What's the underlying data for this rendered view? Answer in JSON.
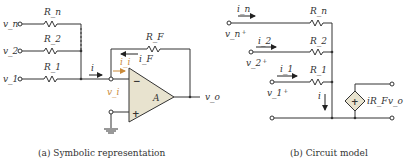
{
  "figure_a": {
    "caption": "(a) Symbolic representation",
    "inputs": [
      {
        "voltage": "v_n",
        "resistor": "R_n"
      },
      {
        "voltage": "v_2",
        "resistor": "R_2"
      },
      {
        "voltage": "v_1",
        "resistor": "R_1"
      }
    ],
    "feedback_resistor": "R_F",
    "feedback_current": "i_F",
    "input_current": "i",
    "inverting_current": "i_i",
    "inverting_voltage": "v_i",
    "opamp_gain": "A",
    "minus_sign": "−",
    "plus_sign": "+",
    "output": "v_o",
    "colors": {
      "opamp_fill": "#e8e3cf",
      "highlight": "#c98a3a"
    }
  },
  "figure_b": {
    "caption": "(b) Circuit model",
    "branches": [
      {
        "current": "i_n",
        "resistor": "R_n",
        "voltage": "v_n"
      },
      {
        "current": "i_2",
        "resistor": "R_2",
        "voltage": "v_2"
      },
      {
        "current": "i_1",
        "resistor": "R_1",
        "voltage": "v_1"
      }
    ],
    "sum_current": "i",
    "dependent_source": "iR_F",
    "source_sign": "+",
    "output": "v_o"
  }
}
